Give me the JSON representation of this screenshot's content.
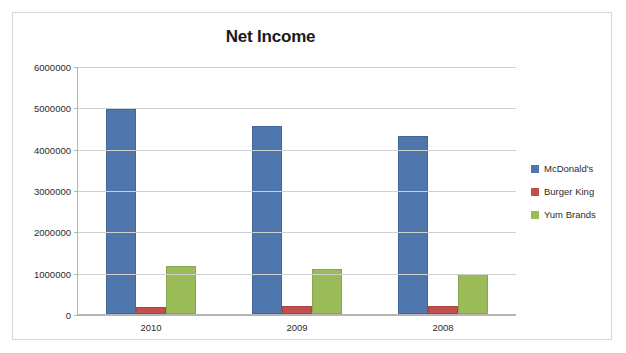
{
  "chart_data": {
    "type": "bar",
    "title": "Net Income",
    "xlabel": "",
    "ylabel": "",
    "categories": [
      "2010",
      "2009",
      "2008"
    ],
    "series": [
      {
        "name": "McDonald's",
        "color": "#4F77AD",
        "values": [
          4950000,
          4550000,
          4310000
        ]
      },
      {
        "name": "Burger King",
        "color": "#C0504D",
        "values": [
          170000,
          200000,
          190000
        ]
      },
      {
        "name": "Yum Brands",
        "color": "#9BBB59",
        "values": [
          1160000,
          1080000,
          970000
        ]
      }
    ],
    "ylim": [
      0,
      6000000
    ],
    "ytick_step": 1000000,
    "yticks": [
      "6000000",
      "5000000",
      "4000000",
      "3000000",
      "2000000",
      "1000000",
      "0"
    ],
    "grid": true,
    "legend_position": "right"
  }
}
